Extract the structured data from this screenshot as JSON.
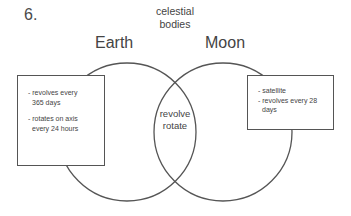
{
  "question_number": "6.",
  "title": "celestial\nbodies",
  "title_lines": [
    "celestial",
    "bodies"
  ],
  "sets": [
    {
      "name": "Earth",
      "unique_items": [
        [
          "- revolves every",
          "365 days"
        ],
        [
          "- rotates on axis",
          "every 24 hours"
        ]
      ]
    },
    {
      "name": "Moon",
      "unique_items": [
        [
          "- satellite"
        ],
        [
          "- revolves every 28",
          "days"
        ]
      ]
    }
  ],
  "overlap": {
    "items": [
      "revolve",
      "rotate"
    ]
  },
  "colors": {
    "stroke": "#555555",
    "text": "#444444",
    "background": "#ffffff"
  }
}
